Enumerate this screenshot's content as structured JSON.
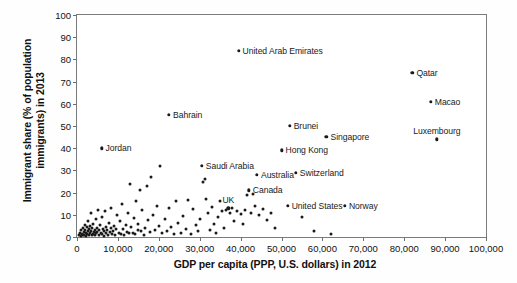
{
  "chart_data": {
    "type": "scatter",
    "title": "",
    "xlabel": "GDP per capita (PPP, U.S. dollars) in 2012",
    "ylabel": "Immigrant share (% of population\nimmigrants) in 2013",
    "xlim": [
      0,
      100000
    ],
    "ylim": [
      0,
      100
    ],
    "grid": false,
    "legend": null,
    "xticks": [
      "0",
      "10,000",
      "20,000",
      "30,000",
      "40,000",
      "50,000",
      "60,000",
      "70,000",
      "80,000",
      "90,000",
      "100,000"
    ],
    "xtick_values": [
      0,
      10000,
      20000,
      30000,
      40000,
      50000,
      60000,
      70000,
      80000,
      90000,
      100000
    ],
    "yticks": [
      "0",
      "10",
      "20",
      "30",
      "40",
      "50",
      "60",
      "70",
      "80",
      "90",
      "100"
    ],
    "ytick_values": [
      0,
      10,
      20,
      30,
      40,
      50,
      60,
      70,
      80,
      90,
      100
    ],
    "marker_color": "#1a1a1a",
    "labeled_points": [
      {
        "name": "United Arab Emirates",
        "x": 39500,
        "y": 84,
        "pos": "left"
      },
      {
        "name": "Qatar",
        "x": 82000,
        "y": 74,
        "pos": "left"
      },
      {
        "name": "Macao",
        "x": 86500,
        "y": 61,
        "pos": "left"
      },
      {
        "name": "Bahrain",
        "x": 22500,
        "y": 55,
        "pos": "left"
      },
      {
        "name": "Brunei",
        "x": 52000,
        "y": 50,
        "pos": "left"
      },
      {
        "name": "Singapore",
        "x": 61000,
        "y": 45,
        "pos": "left"
      },
      {
        "name": "Luxembourg",
        "x": 88000,
        "y": 44,
        "pos": "above"
      },
      {
        "name": "Hong Kong",
        "x": 50000,
        "y": 39,
        "pos": "left"
      },
      {
        "name": "Jordan",
        "x": 6000,
        "y": 40,
        "pos": "left"
      },
      {
        "name": "Saudi Arabia",
        "x": 30500,
        "y": 32,
        "pos": "left"
      },
      {
        "name": "Switzerland",
        "x": 53500,
        "y": 29,
        "pos": "left"
      },
      {
        "name": "Australia",
        "x": 44000,
        "y": 28,
        "pos": "left"
      },
      {
        "name": "Canada",
        "x": 42000,
        "y": 21,
        "pos": "left"
      },
      {
        "name": "UK",
        "x": 37000,
        "y": 13,
        "pos": "above"
      },
      {
        "name": "United States",
        "x": 51500,
        "y": 14,
        "pos": "left"
      },
      {
        "name": "Norway",
        "x": 65500,
        "y": 14,
        "pos": "left"
      }
    ],
    "unlabeled_points": [
      {
        "x": 500,
        "y": 1
      },
      {
        "x": 700,
        "y": 2
      },
      {
        "x": 900,
        "y": 0.5
      },
      {
        "x": 1100,
        "y": 3
      },
      {
        "x": 1200,
        "y": 1.5
      },
      {
        "x": 1400,
        "y": 0.8
      },
      {
        "x": 1500,
        "y": 4
      },
      {
        "x": 1600,
        "y": 2.2
      },
      {
        "x": 1800,
        "y": 1
      },
      {
        "x": 1900,
        "y": 5.5
      },
      {
        "x": 2000,
        "y": 3
      },
      {
        "x": 2100,
        "y": 0.6
      },
      {
        "x": 2200,
        "y": 2
      },
      {
        "x": 2400,
        "y": 4.5
      },
      {
        "x": 2500,
        "y": 1.2
      },
      {
        "x": 2600,
        "y": 7
      },
      {
        "x": 2700,
        "y": 2.8
      },
      {
        "x": 2900,
        "y": 0.9
      },
      {
        "x": 3000,
        "y": 3.5
      },
      {
        "x": 3100,
        "y": 5
      },
      {
        "x": 3200,
        "y": 1.8
      },
      {
        "x": 3400,
        "y": 2.5
      },
      {
        "x": 3500,
        "y": 11
      },
      {
        "x": 3600,
        "y": 0.7
      },
      {
        "x": 3700,
        "y": 4
      },
      {
        "x": 3900,
        "y": 1.4
      },
      {
        "x": 4000,
        "y": 6
      },
      {
        "x": 4100,
        "y": 2.2
      },
      {
        "x": 4300,
        "y": 3.2
      },
      {
        "x": 4400,
        "y": 0.8
      },
      {
        "x": 4600,
        "y": 8
      },
      {
        "x": 4700,
        "y": 1.6
      },
      {
        "x": 4900,
        "y": 4.2
      },
      {
        "x": 5000,
        "y": 2.4
      },
      {
        "x": 5200,
        "y": 12
      },
      {
        "x": 5300,
        "y": 1
      },
      {
        "x": 5500,
        "y": 3
      },
      {
        "x": 5600,
        "y": 5.5
      },
      {
        "x": 5800,
        "y": 2
      },
      {
        "x": 6000,
        "y": 1.2
      },
      {
        "x": 6200,
        "y": 9
      },
      {
        "x": 6400,
        "y": 3.8
      },
      {
        "x": 6500,
        "y": 0.6
      },
      {
        "x": 6700,
        "y": 2.6
      },
      {
        "x": 6900,
        "y": 11.5
      },
      {
        "x": 7000,
        "y": 4.6
      },
      {
        "x": 7200,
        "y": 1.8
      },
      {
        "x": 7400,
        "y": 3
      },
      {
        "x": 7600,
        "y": 0.9
      },
      {
        "x": 7800,
        "y": 6.5
      },
      {
        "x": 8000,
        "y": 2.2
      },
      {
        "x": 8200,
        "y": 13
      },
      {
        "x": 8400,
        "y": 4
      },
      {
        "x": 8600,
        "y": 1.5
      },
      {
        "x": 8800,
        "y": 2.8
      },
      {
        "x": 9000,
        "y": 5
      },
      {
        "x": 9300,
        "y": 1
      },
      {
        "x": 9600,
        "y": 3.4
      },
      {
        "x": 9900,
        "y": 10
      },
      {
        "x": 10200,
        "y": 2
      },
      {
        "x": 10500,
        "y": 7
      },
      {
        "x": 10800,
        "y": 1.4
      },
      {
        "x": 11000,
        "y": 15
      },
      {
        "x": 11300,
        "y": 3.6
      },
      {
        "x": 11600,
        "y": 0.8
      },
      {
        "x": 11900,
        "y": 5.2
      },
      {
        "x": 12200,
        "y": 2.4
      },
      {
        "x": 12500,
        "y": 11
      },
      {
        "x": 12800,
        "y": 1.6
      },
      {
        "x": 13000,
        "y": 24
      },
      {
        "x": 13300,
        "y": 4.4
      },
      {
        "x": 13600,
        "y": 2
      },
      {
        "x": 13900,
        "y": 8.5
      },
      {
        "x": 14200,
        "y": 1.2
      },
      {
        "x": 14500,
        "y": 16
      },
      {
        "x": 14800,
        "y": 3
      },
      {
        "x": 15000,
        "y": 5.8
      },
      {
        "x": 15400,
        "y": 21
      },
      {
        "x": 15700,
        "y": 2.6
      },
      {
        "x": 16000,
        "y": 12
      },
      {
        "x": 16300,
        "y": 1
      },
      {
        "x": 16600,
        "y": 4
      },
      {
        "x": 17000,
        "y": 23
      },
      {
        "x": 17400,
        "y": 7.5
      },
      {
        "x": 17800,
        "y": 2.2
      },
      {
        "x": 18200,
        "y": 27
      },
      {
        "x": 18600,
        "y": 10
      },
      {
        "x": 19000,
        "y": 3.2
      },
      {
        "x": 19500,
        "y": 14
      },
      {
        "x": 20000,
        "y": 5
      },
      {
        "x": 20400,
        "y": 32
      },
      {
        "x": 20900,
        "y": 1.8
      },
      {
        "x": 21400,
        "y": 8
      },
      {
        "x": 21900,
        "y": 2.5
      },
      {
        "x": 22400,
        "y": 13
      },
      {
        "x": 23000,
        "y": 4.5
      },
      {
        "x": 23600,
        "y": 1.2
      },
      {
        "x": 24200,
        "y": 16
      },
      {
        "x": 24800,
        "y": 6.5
      },
      {
        "x": 25400,
        "y": 2
      },
      {
        "x": 26000,
        "y": 9.5
      },
      {
        "x": 26600,
        "y": 3.5
      },
      {
        "x": 27200,
        "y": 16.5
      },
      {
        "x": 27800,
        "y": 1.5
      },
      {
        "x": 28400,
        "y": 12.5
      },
      {
        "x": 29000,
        "y": 5.5
      },
      {
        "x": 29600,
        "y": 2.8
      },
      {
        "x": 30000,
        "y": 8
      },
      {
        "x": 30800,
        "y": 25
      },
      {
        "x": 31200,
        "y": 26
      },
      {
        "x": 31600,
        "y": 17
      },
      {
        "x": 32000,
        "y": 11
      },
      {
        "x": 32500,
        "y": 3
      },
      {
        "x": 33000,
        "y": 13.5
      },
      {
        "x": 33500,
        "y": 6
      },
      {
        "x": 34000,
        "y": 1.8
      },
      {
        "x": 34500,
        "y": 9
      },
      {
        "x": 35000,
        "y": 16
      },
      {
        "x": 35500,
        "y": 11.5
      },
      {
        "x": 36000,
        "y": 4
      },
      {
        "x": 36500,
        "y": 12
      },
      {
        "x": 37500,
        "y": 11
      },
      {
        "x": 38000,
        "y": 13
      },
      {
        "x": 38500,
        "y": 7
      },
      {
        "x": 39000,
        "y": 11.5
      },
      {
        "x": 40000,
        "y": 10.5
      },
      {
        "x": 40500,
        "y": 6
      },
      {
        "x": 41000,
        "y": 12
      },
      {
        "x": 41500,
        "y": 19
      },
      {
        "x": 42500,
        "y": 11
      },
      {
        "x": 43000,
        "y": 19.5
      },
      {
        "x": 43500,
        "y": 14
      },
      {
        "x": 44500,
        "y": 10
      },
      {
        "x": 45500,
        "y": 12.5
      },
      {
        "x": 46500,
        "y": 7.5
      },
      {
        "x": 47500,
        "y": 11
      },
      {
        "x": 48500,
        "y": 4
      },
      {
        "x": 55000,
        "y": 9
      },
      {
        "x": 58000,
        "y": 2.5
      },
      {
        "x": 62000,
        "y": 1.5
      }
    ]
  }
}
